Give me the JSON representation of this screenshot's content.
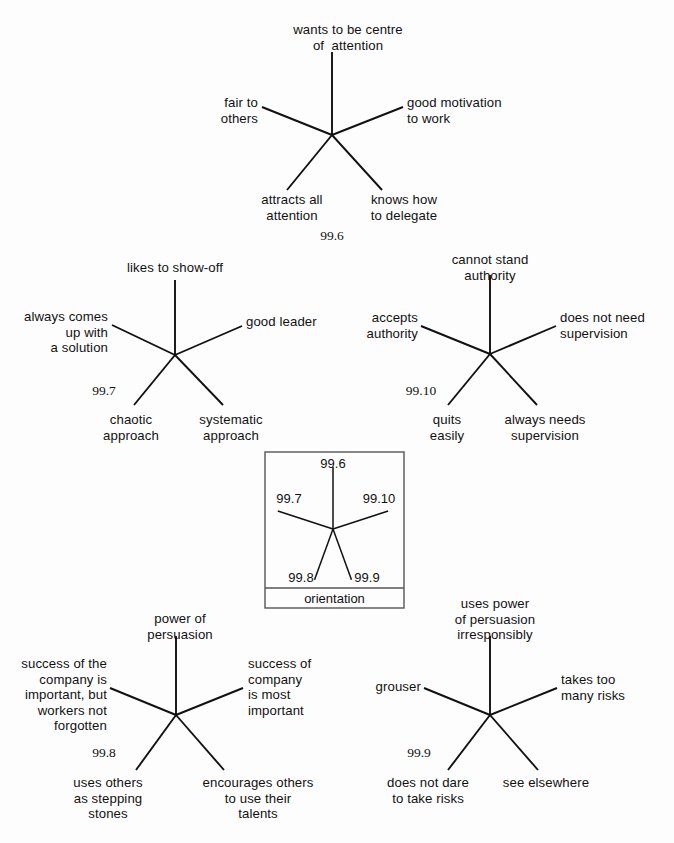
{
  "page": {
    "background_color": "#fdfdfd",
    "ink_color": "#111111",
    "width": 674,
    "height": 843
  },
  "legend": {
    "name": "orientation-key",
    "title": "orientation",
    "box": {
      "x": 265,
      "y": 452,
      "width": 139,
      "height": 156,
      "divider_y": 588,
      "border_color": "#555555"
    },
    "center": {
      "x": 333,
      "y": 529
    },
    "rays": [
      {
        "label": "99.6",
        "angle_deg": -90,
        "length": 62,
        "label_x": 333,
        "label_y": 456,
        "align": "center"
      },
      {
        "label": "99.7",
        "angle_deg": -162,
        "length": 58,
        "label_x": 289,
        "label_y": 491,
        "align": "center"
      },
      {
        "label": "99.10",
        "angle_deg": -18,
        "length": 58,
        "label_x": 379,
        "label_y": 491,
        "align": "center"
      },
      {
        "label": "99.8",
        "angle_deg": 110,
        "length": 54,
        "label_x": 301,
        "label_y": 570,
        "align": "center"
      },
      {
        "label": "99.9",
        "angle_deg": 70,
        "length": 54,
        "label_x": 367,
        "label_y": 570,
        "align": "center"
      }
    ]
  },
  "diagrams": [
    {
      "id": "fig-99-6",
      "figure_number": "99.6",
      "fignum_x": 332,
      "fignum_y": 228,
      "center": {
        "x": 332,
        "y": 135
      },
      "rays": [
        {
          "position": "top",
          "endpoint": {
            "x": 332,
            "y": 52
          },
          "label": "wants to be centre\nof  attention",
          "label_x": 348,
          "label_y": 22,
          "align": "center"
        },
        {
          "position": "upper-left",
          "endpoint": {
            "x": 262,
            "y": 107
          },
          "label": "fair to\nothers",
          "label_x": 258,
          "label_y": 95,
          "align": "right"
        },
        {
          "position": "upper-right",
          "endpoint": {
            "x": 403,
            "y": 107
          },
          "label": "good motivation\nto work",
          "label_x": 407,
          "label_y": 95,
          "align": "left"
        },
        {
          "position": "lower-left",
          "endpoint": {
            "x": 287,
            "y": 190
          },
          "label": "attracts all\nattention",
          "label_x": 292,
          "label_y": 192,
          "align": "center"
        },
        {
          "position": "lower-right",
          "endpoint": {
            "x": 382,
            "y": 190
          },
          "label": "knows how\nto delegate",
          "label_x": 404,
          "label_y": 192,
          "align": "center"
        }
      ]
    },
    {
      "id": "fig-99-7",
      "figure_number": "99.7",
      "fignum_x": 104,
      "fignum_y": 383,
      "center": {
        "x": 175,
        "y": 355
      },
      "rays": [
        {
          "position": "top",
          "endpoint": {
            "x": 175,
            "y": 280
          },
          "label": "likes to show-off",
          "label_x": 175,
          "label_y": 260,
          "align": "center"
        },
        {
          "position": "upper-left",
          "endpoint": {
            "x": 112,
            "y": 325
          },
          "label": "always comes\nup with\na solution",
          "label_x": 108,
          "label_y": 309,
          "align": "right"
        },
        {
          "position": "upper-right",
          "endpoint": {
            "x": 242,
            "y": 326
          },
          "label": "good leader",
          "label_x": 246,
          "label_y": 314,
          "align": "left"
        },
        {
          "position": "lower-left",
          "endpoint": {
            "x": 134,
            "y": 405
          },
          "label": "chaotic\napproach",
          "label_x": 131,
          "label_y": 412,
          "align": "center"
        },
        {
          "position": "lower-right",
          "endpoint": {
            "x": 223,
            "y": 405
          },
          "label": "systematic\napproach",
          "label_x": 231,
          "label_y": 412,
          "align": "center"
        }
      ]
    },
    {
      "id": "fig-99-10",
      "figure_number": "99.10",
      "fignum_x": 421,
      "fignum_y": 383,
      "center": {
        "x": 490,
        "y": 354
      },
      "rays": [
        {
          "position": "top",
          "endpoint": {
            "x": 490,
            "y": 275
          },
          "label": "cannot stand\nauthority",
          "label_x": 490,
          "label_y": 252,
          "align": "center"
        },
        {
          "position": "upper-left",
          "endpoint": {
            "x": 421,
            "y": 326
          },
          "label": "accepts\nauthority",
          "label_x": 418,
          "label_y": 310,
          "align": "right"
        },
        {
          "position": "upper-right",
          "endpoint": {
            "x": 556,
            "y": 326
          },
          "label": "does not need\nsupervision",
          "label_x": 560,
          "label_y": 310,
          "align": "left"
        },
        {
          "position": "lower-left",
          "endpoint": {
            "x": 448,
            "y": 405
          },
          "label": "quits\neasily",
          "label_x": 447,
          "label_y": 412,
          "align": "center"
        },
        {
          "position": "lower-right",
          "endpoint": {
            "x": 537,
            "y": 405
          },
          "label": "always needs\nsupervision",
          "label_x": 545,
          "label_y": 412,
          "align": "center"
        }
      ]
    },
    {
      "id": "fig-99-8",
      "figure_number": "99.8",
      "fignum_x": 104,
      "fignum_y": 745,
      "center": {
        "x": 176,
        "y": 715
      },
      "rays": [
        {
          "position": "top",
          "endpoint": {
            "x": 176,
            "y": 636
          },
          "label": "power of\npersuasion",
          "label_x": 180,
          "label_y": 611,
          "align": "center"
        },
        {
          "position": "upper-left",
          "endpoint": {
            "x": 110,
            "y": 688
          },
          "label": "success of the\ncompany is\nimportant, but\nworkers not\nforgotten",
          "label_x": 107,
          "label_y": 656,
          "align": "right"
        },
        {
          "position": "upper-right",
          "endpoint": {
            "x": 243,
            "y": 688
          },
          "label": "success of\ncompany\nis most\nimportant",
          "label_x": 248,
          "label_y": 656,
          "align": "left"
        },
        {
          "position": "lower-left",
          "endpoint": {
            "x": 136,
            "y": 770
          },
          "label": "uses others\nas stepping\nstones",
          "label_x": 108,
          "label_y": 775,
          "align": "center"
        },
        {
          "position": "lower-right",
          "endpoint": {
            "x": 224,
            "y": 770
          },
          "label": "encourages others\nto use their\ntalents",
          "label_x": 258,
          "label_y": 775,
          "align": "center"
        }
      ]
    },
    {
      "id": "fig-99-9",
      "figure_number": "99.9",
      "fignum_x": 419,
      "fignum_y": 745,
      "center": {
        "x": 490,
        "y": 715
      },
      "rays": [
        {
          "position": "top",
          "endpoint": {
            "x": 490,
            "y": 636
          },
          "label": "uses power\nof persuasion\nirresponsibly",
          "label_x": 495,
          "label_y": 596,
          "align": "center"
        },
        {
          "position": "upper-left",
          "endpoint": {
            "x": 424,
            "y": 688
          },
          "label": "grouser",
          "label_x": 421,
          "label_y": 679,
          "align": "right"
        },
        {
          "position": "upper-right",
          "endpoint": {
            "x": 557,
            "y": 688
          },
          "label": "takes too\nmany risks",
          "label_x": 561,
          "label_y": 672,
          "align": "left"
        },
        {
          "position": "lower-left",
          "endpoint": {
            "x": 448,
            "y": 770
          },
          "label": "does not dare\nto take risks",
          "label_x": 428,
          "label_y": 775,
          "align": "center"
        },
        {
          "position": "lower-right",
          "endpoint": {
            "x": 538,
            "y": 770
          },
          "label": "see elsewhere",
          "label_x": 546,
          "label_y": 775,
          "align": "center"
        }
      ]
    }
  ]
}
